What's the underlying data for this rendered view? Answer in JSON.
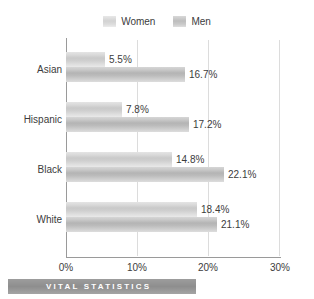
{
  "chart_data": {
    "type": "bar",
    "orientation": "horizontal",
    "title": "",
    "xlabel": "",
    "ylabel": "",
    "categories": [
      "Asian",
      "Hispanic",
      "Black",
      "White"
    ],
    "series": [
      {
        "name": "Women",
        "values": [
          5.5,
          7.8,
          14.8,
          18.4
        ],
        "labels": [
          "5.5%",
          "7.8%",
          "14.8%",
          "18.4%"
        ],
        "color": "#cfcfcf"
      },
      {
        "name": "Men",
        "values": [
          16.7,
          17.2,
          22.1,
          21.1
        ],
        "labels": [
          "16.7%",
          "17.2%",
          "22.1%",
          "21.1%"
        ],
        "color": "#bcbcbc"
      }
    ],
    "xlim": [
      0,
      30
    ],
    "xticks": [
      0,
      10,
      20,
      30
    ],
    "xticklabels": [
      "0%",
      "10%",
      "20%",
      "30%"
    ],
    "grid": true,
    "legend_position": "top-center"
  },
  "legend": {
    "entries": [
      {
        "label": "Women",
        "swatch": "legend-swatch-women"
      },
      {
        "label": "Men",
        "swatch": "legend-swatch-men"
      }
    ]
  },
  "footer": {
    "banner_text": "VITAL STATISTICS"
  }
}
